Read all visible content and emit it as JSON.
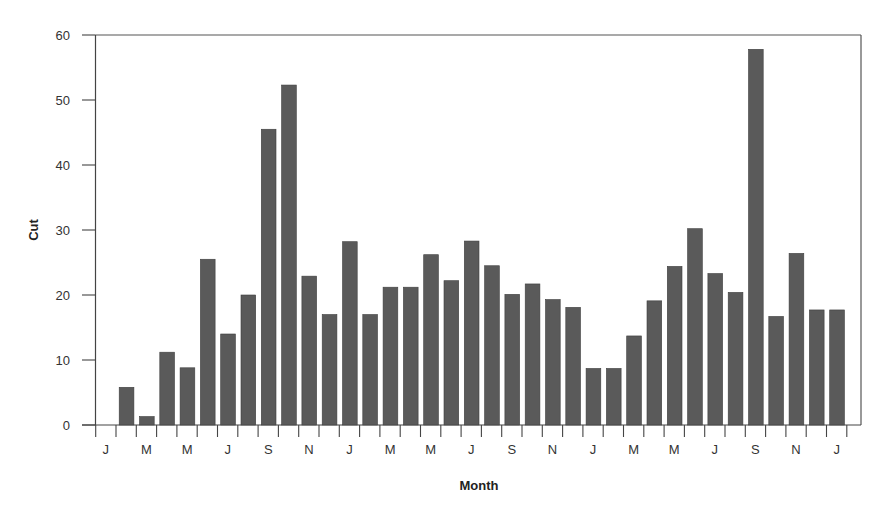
{
  "chart_data": {
    "type": "bar",
    "title": "",
    "xlabel": "Month",
    "ylabel": "Cut",
    "ylim": [
      0,
      60
    ],
    "yticks": [
      0,
      10,
      20,
      30,
      40,
      50,
      60
    ],
    "grid": false,
    "legend": null,
    "x_tick_labels": [
      "J",
      "M",
      "M",
      "J",
      "S",
      "N",
      "J",
      "M",
      "M",
      "J",
      "S",
      "N",
      "J",
      "M",
      "M",
      "J",
      "S",
      "N",
      "J"
    ],
    "categories": [
      "Jan",
      "Feb",
      "Mar",
      "Apr",
      "May",
      "Jun",
      "Jul",
      "Aug",
      "Sep",
      "Oct",
      "Nov",
      "Dec",
      "Jan",
      "Feb",
      "Mar",
      "Apr",
      "May",
      "Jun",
      "Jul",
      "Aug",
      "Sep",
      "Oct",
      "Nov",
      "Dec",
      "Jan",
      "Feb",
      "Mar",
      "Apr",
      "May",
      "Jun",
      "Jul",
      "Aug",
      "Sep",
      "Oct",
      "Nov",
      "Dec",
      "Jan"
    ],
    "values": [
      0,
      5.8,
      1.3,
      11.2,
      8.8,
      25.5,
      14.0,
      20.0,
      45.5,
      52.3,
      22.9,
      17.0,
      28.2,
      17.0,
      21.2,
      21.2,
      26.2,
      22.2,
      28.3,
      24.5,
      20.1,
      21.7,
      19.3,
      18.1,
      8.7,
      8.7,
      13.7,
      19.1,
      24.4,
      30.2,
      23.3,
      20.4,
      57.8,
      16.7,
      26.4,
      17.7,
      17.7
    ],
    "bar_color": "#5a5a5a"
  }
}
